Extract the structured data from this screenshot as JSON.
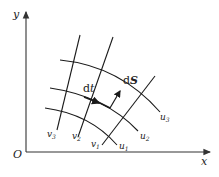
{
  "diagram": {
    "type": "curvilinear-coordinate-grid",
    "axes": {
      "origin_label": "O",
      "x_label": "x",
      "y_label": "y"
    },
    "u_curves": [
      {
        "label": "u",
        "subscript": "1"
      },
      {
        "label": "u",
        "subscript": "2"
      },
      {
        "label": "u",
        "subscript": "3"
      }
    ],
    "v_curves": [
      {
        "label": "v",
        "subscript": "1"
      },
      {
        "label": "v",
        "subscript": "2"
      },
      {
        "label": "v",
        "subscript": "3"
      }
    ],
    "vectors": {
      "tangent_label": "dt",
      "tangent_prefix": "d",
      "tangent_var": "t",
      "area_label": "dS",
      "area_prefix": "d",
      "area_var": "S"
    },
    "colors": {
      "ink": "#1a1a1a",
      "background": "#ffffff"
    }
  }
}
